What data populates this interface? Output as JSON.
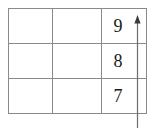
{
  "figure": {
    "type": "grid-with-axis-arrow",
    "background_color": "#ffffff",
    "grid": {
      "rows": 3,
      "columns": 3,
      "border_color": "#8a8a8a",
      "cells": [
        [
          "",
          "",
          "9"
        ],
        [
          "",
          "",
          "8"
        ],
        [
          "",
          "",
          "7"
        ]
      ]
    },
    "axis": {
      "name": "vertical-axis-arrow",
      "direction": "up",
      "color": "#6b6b6b",
      "labels": [
        "9",
        "8",
        "7"
      ]
    }
  }
}
